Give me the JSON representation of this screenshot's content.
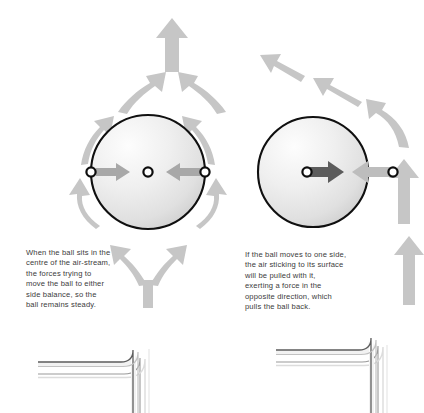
{
  "figure": {
    "background_color": "#ffffff"
  },
  "colors": {
    "arrow_gray": "#c6c6c6",
    "arrow_gray_dark": "#bdbdbd",
    "ball_outline": "#101010",
    "ball_fill_light": "#fcfcfc",
    "ball_fill_dark": "#d4d4d4",
    "force_arrow_gray": "#a8a8a8",
    "force_arrow_dark": "#5c5c5c",
    "dot_outline": "#0d0d0d",
    "dot_fill": "#ffffff",
    "pipe_outline": "#6f6f6f",
    "pipe_fill_light": "#ffffff",
    "pipe_fill_dark": "#b8b8b8",
    "text": "#3b3b3b"
  },
  "panels": {
    "left": {
      "name": "centred-ball-panel",
      "caption": "When the ball sits in the\ncentre of the air-stream,\nthe forces trying to\nmove the ball to either\nside balance, so the\nball remains steady.",
      "ball": {
        "cx": 148,
        "cy": 172,
        "r": 57
      },
      "centre_dot": {
        "cx": 148,
        "cy": 172
      },
      "left_dot": {
        "cx": 91,
        "cy": 172
      },
      "right_dot": {
        "cx": 205,
        "cy": 172
      },
      "force_arrows": [
        {
          "name": "left-force-arrow",
          "direction": "right",
          "from_x": 94,
          "to_x": 128,
          "y": 172
        },
        {
          "name": "right-force-arrow",
          "direction": "left",
          "from_x": 202,
          "to_x": 168,
          "y": 172
        }
      ],
      "airflow": {
        "description": "Air splits at the bottom of the ball, sweeps symmetrically around both sides and rejoins above it into a single upward jet.",
        "exit_arrow": {
          "x": 172,
          "y_top": 22,
          "y_bottom": 72
        }
      }
    },
    "right": {
      "name": "displaced-ball-panel",
      "caption": "If the ball moves to one side,\nthe air sticking to its surface\nwill be pulled with it,\nexerting a force in the\nopposite direction, which\npulls the ball back.",
      "ball": {
        "cx": 313,
        "cy": 172,
        "r": 55
      },
      "centre_dot": {
        "cx": 307,
        "cy": 172
      },
      "right_dot": {
        "cx": 393,
        "cy": 172
      },
      "force_arrows": [
        {
          "name": "ball-displacement-arrow",
          "direction": "right",
          "from_x": 310,
          "to_x": 345,
          "y": 172,
          "color": "dark"
        },
        {
          "name": "restoring-force-arrow",
          "direction": "left",
          "from_x": 390,
          "to_x": 352,
          "y": 172,
          "color": "gray"
        }
      ],
      "airflow": {
        "description": "The air-stream hugs the displaced ball, runs up its right flank and is deflected away to the upper left.",
        "deflection_arrows": 3
      }
    }
  },
  "pipes": [
    {
      "name": "left-nozzle-pipe",
      "shape": "elbow",
      "corner_x": 148,
      "corner_y": 355,
      "horizontal_to_x": 38,
      "vertical_to_y": 413
    },
    {
      "name": "right-nozzle-pipe",
      "shape": "elbow",
      "corner_x": 385,
      "corner_y": 352,
      "horizontal_to_x": 276,
      "vertical_to_y": 413
    }
  ]
}
